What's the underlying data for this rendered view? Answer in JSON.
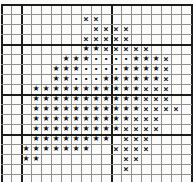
{
  "chart": {
    "kind": "cross-stitch-pattern-grid",
    "columns": 19,
    "rows": 18,
    "cell_px": 10,
    "origin_x_px": 1,
    "origin_y_px": 4,
    "colors": {
      "paper": "#fbfbfa",
      "gridline": "#909090",
      "gridline_bold": "#1c1c1c",
      "symbol": "#111111"
    },
    "bold_column_boundaries": [
      0,
      2,
      11,
      19
    ],
    "bold_row_boundaries": [
      0,
      4,
      9,
      13
    ],
    "symbols": {
      "S": {
        "glyph": "★",
        "name": "star-stitch-symbol",
        "class": "star"
      },
      "X": {
        "glyph": "×",
        "name": "cross-stitch-symbol",
        "class": "cross"
      },
      "D": {
        "glyph": "·",
        "name": "dot-stitch-symbol",
        "class": "dot"
      }
    },
    "pattern_rows": [
      "...................",
      "........XX.........",
      ".........XXXX......",
      "........XXXXX......",
      "........SSXXXXX....",
      "......SSSDDDDSSSX..",
      ".....SSSDDDDSSSSX..",
      ".....SSDDDSSSSSSX..",
      "...SSSSSSSSSSSXXX..",
      "...SSSSSSSSSSSXXX..",
      "...SSSSSSSSSSSXXXX.",
      "...SSSSSSSSSSXXX...",
      "...SSSSSSSSSXXXX...",
      "...SSSSSSSS.XXX....",
      "..SSSSSSS..XXXX....",
      "..SS........XX.....",
      "............X......",
      "..................."
    ]
  }
}
